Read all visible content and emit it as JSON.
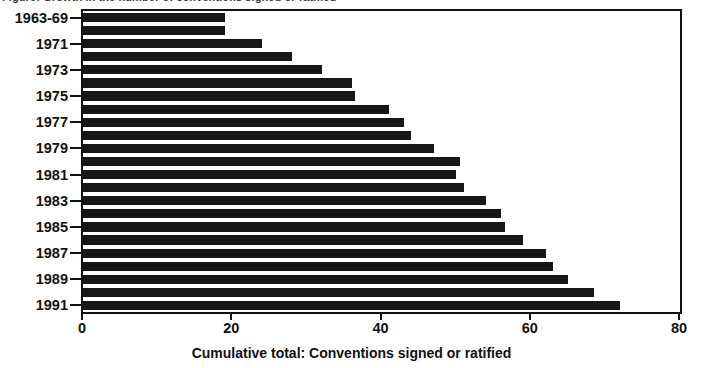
{
  "top_caption": {
    "text": "Figure: Growth in the number of conventions signed or ratified"
  },
  "x_axis": {
    "title": "Cumulative total: Conventions signed or ratified",
    "ticks": [
      "0",
      "20",
      "40",
      "60",
      "80"
    ]
  },
  "y_axis": {
    "visible_labels": [
      "1963-69",
      "1971",
      "1973",
      "1975",
      "1977",
      "1979",
      "1981",
      "1983",
      "1985",
      "1987",
      "1989",
      "1991"
    ]
  },
  "colors": {
    "bar": "#171717",
    "axis": "#111111",
    "background": "#ffffff"
  },
  "chart_data": {
    "type": "bar",
    "orientation": "horizontal",
    "title": "",
    "subtitle": "",
    "xlabel": "Cumulative total: Conventions signed or ratified",
    "ylabel": "",
    "xlim": [
      0,
      80
    ],
    "xticks": [
      0,
      20,
      40,
      60,
      80
    ],
    "grid": false,
    "legend": null,
    "categories": [
      "1963-69",
      "1970",
      "1971",
      "1972",
      "1973",
      "1974",
      "1975",
      "1976",
      "1977",
      "1978",
      "1979",
      "1980",
      "1981",
      "1982",
      "1983",
      "1984",
      "1985",
      "1986",
      "1987",
      "1988",
      "1989",
      "1990",
      "1991"
    ],
    "labelled_categories": [
      "1963-69",
      "1971",
      "1973",
      "1975",
      "1977",
      "1979",
      "1981",
      "1983",
      "1985",
      "1987",
      "1989",
      "1991"
    ],
    "values": [
      19,
      19,
      24,
      28,
      32,
      36,
      36.5,
      41,
      43,
      44,
      47,
      50.5,
      50,
      51,
      54,
      56,
      56.5,
      59,
      62,
      63,
      65,
      68.5,
      72
    ]
  }
}
